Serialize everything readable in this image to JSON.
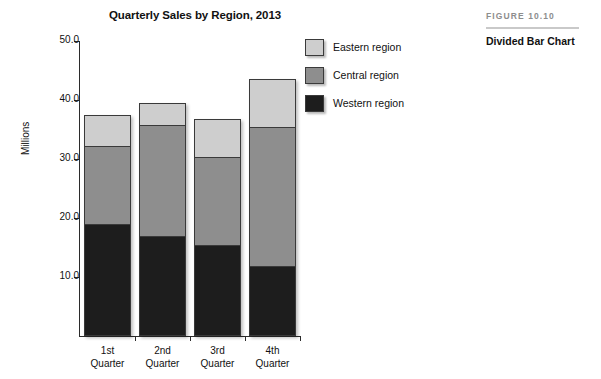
{
  "figure": {
    "kicker": "FIGURE 10.10",
    "caption": "Divided Bar Chart"
  },
  "chart_data": {
    "type": "bar",
    "subtype": "stacked",
    "title": "Quarterly Sales by Region, 2013",
    "xlabel": "",
    "ylabel": "Millions",
    "categories": [
      "1st Quarter",
      "2nd Quarter",
      "3rd Quarter",
      "4th Quarter"
    ],
    "category_lines": [
      [
        "1st",
        "Quarter"
      ],
      [
        "2nd",
        "Quarter"
      ],
      [
        "3rd",
        "Quarter"
      ],
      [
        "4th",
        "Quarter"
      ]
    ],
    "ylim": [
      0,
      50
    ],
    "ytick_values": [
      10,
      20,
      30,
      40,
      50
    ],
    "ytick_labels": [
      "10.0",
      "20.0",
      "30.0",
      "40.0",
      "50.0"
    ],
    "grid": false,
    "legend_position": "top-right",
    "series": [
      {
        "name": "Western region",
        "color": "#1d1d1d",
        "values": [
          19.0,
          17.0,
          15.4,
          11.8
        ]
      },
      {
        "name": "Central region",
        "color": "#8e8e8e",
        "values": [
          13.2,
          18.8,
          14.9,
          23.7
        ]
      },
      {
        "name": "Eastern region",
        "color": "#cecece",
        "values": [
          5.3,
          3.7,
          6.4,
          8.0
        ]
      }
    ],
    "totals": [
      37.5,
      39.5,
      36.7,
      43.5
    ],
    "stack_order_bottom_to_top": [
      "Western region",
      "Central region",
      "Eastern region"
    ],
    "legend_entries": [
      {
        "label": "Eastern region",
        "color": "#cecece"
      },
      {
        "label": "Central region",
        "color": "#8e8e8e"
      },
      {
        "label": "Western region",
        "color": "#1d1d1d"
      }
    ]
  }
}
